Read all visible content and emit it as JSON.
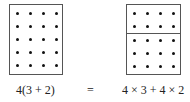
{
  "left_figure": {
    "rows": 5,
    "cols": 4,
    "groups": [
      5
    ],
    "expression": "4(3 + 2)"
  },
  "equals_sign": "=",
  "right_figure": {
    "rows": 5,
    "cols": 4,
    "groups": [
      2,
      3
    ],
    "expression": "4 × 3 + 4 × 2"
  }
}
